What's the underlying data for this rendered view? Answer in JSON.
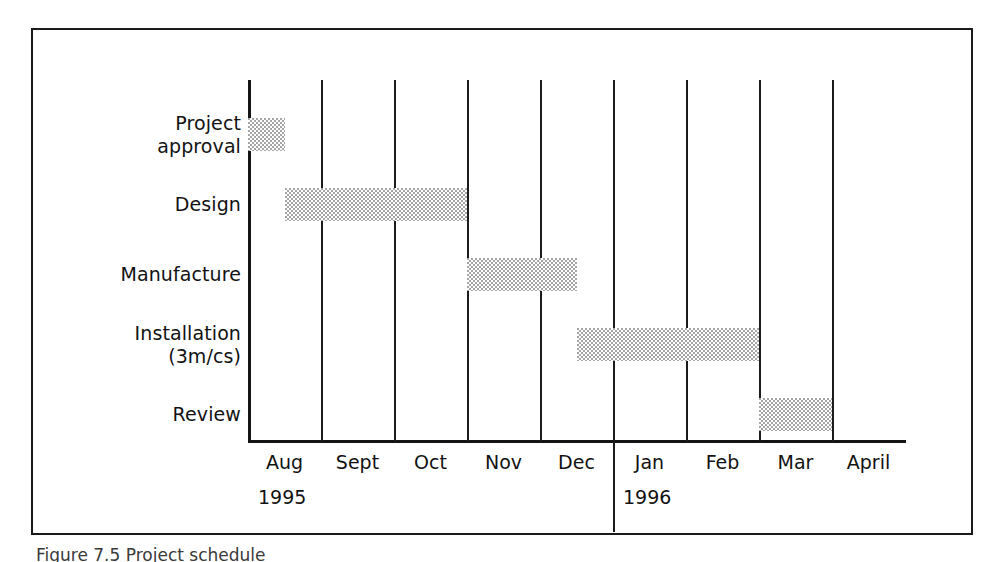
{
  "figure": {
    "caption": "Figure 7.5  Project schedule"
  },
  "chart_data": {
    "type": "bar",
    "subtype": "gantt",
    "title": "",
    "xlabel": "",
    "ylabel": "",
    "grid": true,
    "legend": null,
    "x_unit": "month",
    "x_axis": {
      "categories": [
        "Aug",
        "Sept",
        "Oct",
        "Nov",
        "Dec",
        "Jan",
        "Feb",
        "Mar",
        "April"
      ],
      "groups": [
        {
          "label": "1995",
          "months": [
            "Aug",
            "Sept",
            "Oct",
            "Nov",
            "Dec"
          ]
        },
        {
          "label": "1996",
          "months": [
            "Jan",
            "Feb",
            "Mar",
            "April"
          ]
        }
      ],
      "range": [
        0,
        9
      ]
    },
    "categories": [
      "Project approval",
      "Design",
      "Manufacture",
      "Installation (3m/cs)",
      "Review"
    ],
    "tasks": [
      {
        "name": "Project approval",
        "label": "Project\napproval",
        "start_month": "Aug",
        "end_month": "Aug",
        "start": 0.0,
        "end": 0.5,
        "duration_months": 0.5
      },
      {
        "name": "Design",
        "label": "Design",
        "start_month": "Aug",
        "end_month": "Oct",
        "start": 0.5,
        "end": 3.0,
        "duration_months": 2.5
      },
      {
        "name": "Manufacture",
        "label": "Manufacture",
        "start_month": "Nov",
        "end_month": "Dec",
        "start": 3.0,
        "end": 4.5,
        "duration_months": 1.5
      },
      {
        "name": "Installation",
        "label": "Installation\n(3m/cs)",
        "start_month": "Dec",
        "end_month": "Feb",
        "start": 4.5,
        "end": 7.0,
        "duration_months": 2.5
      },
      {
        "name": "Review",
        "label": "Review",
        "start_month": "Mar",
        "end_month": "Mar",
        "start": 7.0,
        "end": 8.0,
        "duration_months": 1.0
      }
    ],
    "colors": {
      "bar_fill": "#a5a5a5",
      "axis": "#141414",
      "grid": "#1b1b1b",
      "background": "#ffffff",
      "text": "#121212"
    }
  }
}
